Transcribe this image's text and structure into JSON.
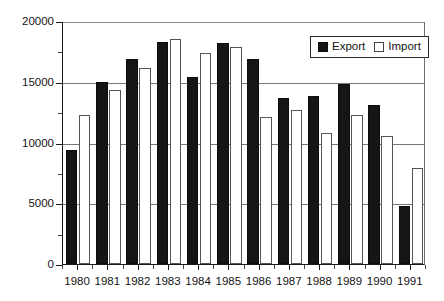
{
  "chart_data": {
    "type": "bar",
    "title": "",
    "subtitle": "",
    "xlabel": "",
    "ylabel": "",
    "categories": [
      "1980",
      "1981",
      "1982",
      "1983",
      "1984",
      "1985",
      "1986",
      "1987",
      "1988",
      "1989",
      "1990",
      "1991"
    ],
    "series": [
      {
        "name": "Export",
        "color": "#151515",
        "values": [
          9400,
          15000,
          16900,
          18300,
          15400,
          18200,
          16900,
          13700,
          13800,
          14800,
          13100,
          4800
        ]
      },
      {
        "name": "Import",
        "color": "#ffffff",
        "values": [
          12300,
          14300,
          16100,
          18500,
          17400,
          17900,
          12100,
          12700,
          10800,
          12300,
          10500,
          7900
        ]
      }
    ],
    "ylim": [
      0,
      20000
    ],
    "yticks": [
      0,
      5000,
      10000,
      15000,
      20000
    ],
    "ytick_labels": [
      "0",
      "5000",
      "10000",
      "15000",
      "20000"
    ],
    "grid": "horizontal",
    "legend_position": "top-right"
  },
  "legend": {
    "entries": [
      {
        "label": "Export",
        "swatch": "filled-black-square"
      },
      {
        "label": "Import",
        "swatch": "white-square"
      }
    ]
  },
  "axes": {
    "y_tick_labels": [
      "20000",
      "15000",
      "10000",
      "5000",
      "0"
    ],
    "x_tick_labels": [
      "1980",
      "1981",
      "1982",
      "1983",
      "1984",
      "1985",
      "1986",
      "1987",
      "1988",
      "1989",
      "1990",
      "1991"
    ]
  }
}
